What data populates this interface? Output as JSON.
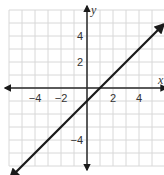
{
  "chart_data": {
    "type": "line",
    "title": "",
    "xlabel": "x",
    "ylabel": "y",
    "xlim": [
      -6,
      6
    ],
    "ylim": [
      -6,
      6
    ],
    "grid": true,
    "x_ticks": [
      -4,
      -2,
      2,
      4
    ],
    "y_ticks": [
      4,
      2,
      -4
    ],
    "x_tick_labels": [
      "−4",
      "−2",
      "2",
      "4"
    ],
    "y_tick_labels": [
      "4",
      "2",
      "−4"
    ],
    "series": [
      {
        "name": "y = x − 1",
        "equation": "y = x - 1",
        "slope": 1,
        "intercept": -1,
        "x": [
          -5.9,
          5.9
        ],
        "y": [
          -6.9,
          4.9
        ],
        "arrows_both_ends": true,
        "color": "#1a1a1a"
      }
    ],
    "colors": {
      "grid": "#d8d8d8",
      "axis": "#2a2a2a",
      "line": "#1a1a1a"
    }
  }
}
